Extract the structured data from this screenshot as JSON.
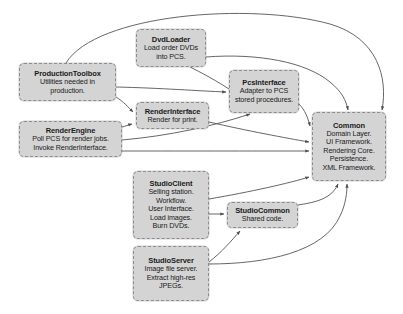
{
  "diagram": {
    "type": "software-architecture-package-diagram",
    "canvas": {
      "width": 403,
      "height": 314,
      "background": "#ffffff"
    },
    "style": {
      "node_fill": "#d4d4d4",
      "node_border": "#8c8c8c",
      "edge_color": "#555555",
      "text_color": "#1a1a1a"
    },
    "nodes": [
      {
        "id": "dvdloader",
        "title": "DvdLoader",
        "lines": [
          "Load order DVDs",
          "into PCS."
        ],
        "x": 136,
        "y": 29,
        "w": 70,
        "h": 38
      },
      {
        "id": "productiontoolbox",
        "title": "ProductionToolbox",
        "lines": [
          "Utilities needed in",
          "production."
        ],
        "x": 19,
        "y": 63,
        "w": 97,
        "h": 38
      },
      {
        "id": "pcsinterface",
        "title": "PcsInterface",
        "lines": [
          "Adapter to PCS",
          "stored procedures."
        ],
        "x": 229,
        "y": 70,
        "w": 70,
        "h": 43
      },
      {
        "id": "renderinterface",
        "title": "RenderInterface",
        "lines": [
          "Render for print."
        ],
        "x": 136,
        "y": 102,
        "w": 73,
        "h": 27
      },
      {
        "id": "renderengine",
        "title": "RenderEngine",
        "lines": [
          "Poll PCS for render jobs.",
          "Invoke RenderInterface."
        ],
        "x": 19,
        "y": 121,
        "w": 103,
        "h": 36
      },
      {
        "id": "common",
        "title": "Common",
        "lines": [
          "Domain Layer.",
          "UI Framework.",
          "Rendering Core.",
          "Persistence.",
          "XML Framework."
        ],
        "x": 312,
        "y": 112,
        "w": 74,
        "h": 69
      },
      {
        "id": "studioclient",
        "title": "StudioClient",
        "lines": [
          "Selling station.",
          "Workflow.",
          "User Interface.",
          "Load images.",
          "Burn DVDs."
        ],
        "x": 133,
        "y": 171,
        "w": 76,
        "h": 68
      },
      {
        "id": "studiocommon",
        "title": "StudioCommon",
        "lines": [
          "Shared code."
        ],
        "x": 227,
        "y": 202,
        "w": 71,
        "h": 26
      },
      {
        "id": "studioserver",
        "title": "StudioServer",
        "lines": [
          "Image file server.",
          "Extract high-res",
          "JPEGs."
        ],
        "x": 133,
        "y": 246,
        "w": 76,
        "h": 55
      }
    ],
    "edges": [
      {
        "id": "e1",
        "from": "productiontoolbox",
        "to": "common",
        "label": ""
      },
      {
        "id": "e2",
        "from": "productiontoolbox",
        "to": "pcsinterface",
        "label": ""
      },
      {
        "id": "e3",
        "from": "productiontoolbox",
        "to": "renderinterface",
        "label": ""
      },
      {
        "id": "e4",
        "from": "dvdloader",
        "to": "common",
        "label": ""
      },
      {
        "id": "e5",
        "from": "dvdloader",
        "to": "pcsinterface",
        "label": ""
      },
      {
        "id": "e6",
        "from": "pcsinterface",
        "to": "common",
        "label": ""
      },
      {
        "id": "e7",
        "from": "renderinterface",
        "to": "common",
        "label": ""
      },
      {
        "id": "e8",
        "from": "renderengine",
        "to": "renderinterface",
        "label": ""
      },
      {
        "id": "e9",
        "from": "renderengine",
        "to": "pcsinterface",
        "label": ""
      },
      {
        "id": "e10",
        "from": "renderengine",
        "to": "common",
        "label": ""
      },
      {
        "id": "e11",
        "from": "studioclient",
        "to": "studiocommon",
        "label": ""
      },
      {
        "id": "e12",
        "from": "studioclient",
        "to": "common",
        "label": ""
      },
      {
        "id": "e13",
        "from": "studiocommon",
        "to": "common",
        "label": ""
      },
      {
        "id": "e14",
        "from": "studioserver",
        "to": "studiocommon",
        "label": ""
      },
      {
        "id": "e15",
        "from": "studioserver",
        "to": "common",
        "label": ""
      }
    ]
  }
}
